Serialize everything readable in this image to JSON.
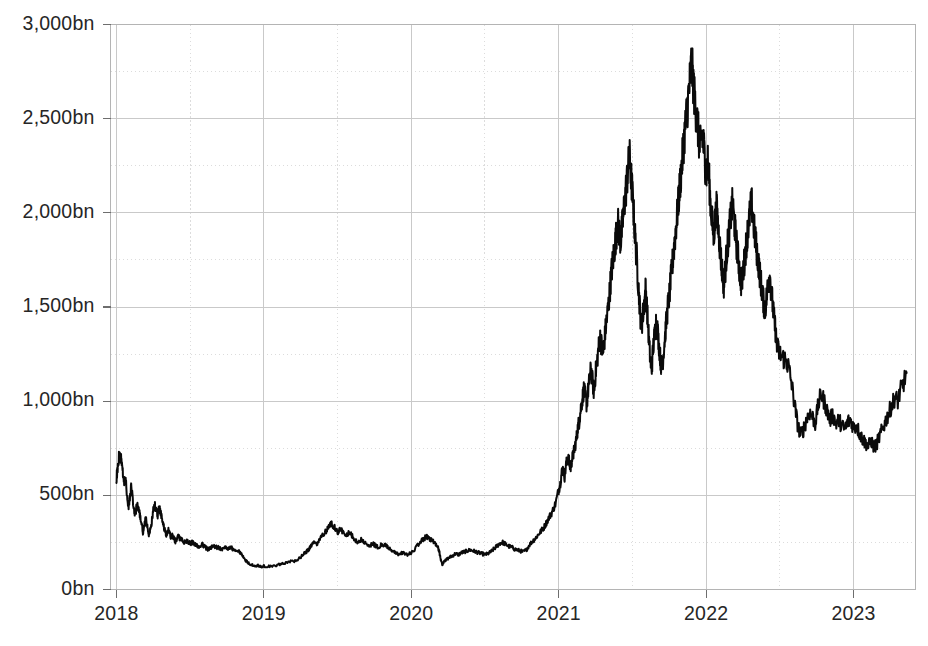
{
  "chart_data": {
    "type": "line",
    "title": "",
    "subtitle": "",
    "xlabel": "",
    "ylabel": "",
    "unit_suffix": "bn",
    "grid": true,
    "minor_grid": true,
    "legend": false,
    "legend_position": "none",
    "line_color": "#0a0a0a",
    "grid_color": "#c9c9c9",
    "minor_grid_color": "#dcdcdc",
    "border_color": "#b4b4b4",
    "label_color": "#262626",
    "background": "#ffffff",
    "xlim": [
      2017.96,
      2023.42
    ],
    "ylim": [
      0,
      3000
    ],
    "y_ticks": [
      0,
      500,
      1000,
      1500,
      2000,
      2500,
      3000
    ],
    "y_tick_labels": [
      "0bn",
      "500bn",
      "1,000bn",
      "1,500bn",
      "2,000bn",
      "2,500bn",
      "3,000bn"
    ],
    "y_minor_ticks": [
      250,
      750,
      1250,
      1750,
      2250,
      2750
    ],
    "x_ticks": [
      2018,
      2019,
      2020,
      2021,
      2022,
      2023
    ],
    "x_tick_labels": [
      "2018",
      "2019",
      "2020",
      "2021",
      "2022",
      "2023"
    ],
    "x_minor_ticks": [
      2018.5,
      2019.5,
      2020.5,
      2021.5,
      2022.5,
      2023.5
    ],
    "series": [
      {
        "name": "Market capitalisation",
        "color": "#0a0a0a",
        "x": [
          2018.0,
          2018.01,
          2018.02,
          2018.03,
          2018.04,
          2018.05,
          2018.06,
          2018.07,
          2018.08,
          2018.09,
          2018.1,
          2018.11,
          2018.12,
          2018.13,
          2018.14,
          2018.15,
          2018.16,
          2018.17,
          2018.18,
          2018.19,
          2018.2,
          2018.21,
          2018.22,
          2018.23,
          2018.24,
          2018.25,
          2018.26,
          2018.27,
          2018.28,
          2018.29,
          2018.3,
          2018.31,
          2018.32,
          2018.33,
          2018.34,
          2018.35,
          2018.36,
          2018.37,
          2018.38,
          2018.39,
          2018.4,
          2018.42,
          2018.44,
          2018.46,
          2018.48,
          2018.5,
          2018.52,
          2018.54,
          2018.56,
          2018.58,
          2018.6,
          2018.62,
          2018.64,
          2018.66,
          2018.68,
          2018.7,
          2018.72,
          2018.74,
          2018.76,
          2018.78,
          2018.8,
          2018.82,
          2018.84,
          2018.86,
          2018.88,
          2018.9,
          2018.92,
          2018.94,
          2018.96,
          2018.98,
          2019.0,
          2019.04,
          2019.08,
          2019.12,
          2019.16,
          2019.2,
          2019.24,
          2019.28,
          2019.3,
          2019.32,
          2019.34,
          2019.36,
          2019.38,
          2019.4,
          2019.42,
          2019.44,
          2019.46,
          2019.48,
          2019.5,
          2019.52,
          2019.54,
          2019.56,
          2019.58,
          2019.6,
          2019.62,
          2019.64,
          2019.66,
          2019.68,
          2019.7,
          2019.72,
          2019.74,
          2019.76,
          2019.78,
          2019.8,
          2019.82,
          2019.84,
          2019.86,
          2019.88,
          2019.9,
          2019.92,
          2019.94,
          2019.96,
          2019.98,
          2020.0,
          2020.04,
          2020.06,
          2020.08,
          2020.1,
          2020.12,
          2020.14,
          2020.16,
          2020.18,
          2020.19,
          2020.2,
          2020.21,
          2020.22,
          2020.24,
          2020.26,
          2020.28,
          2020.3,
          2020.32,
          2020.34,
          2020.36,
          2020.38,
          2020.4,
          2020.42,
          2020.44,
          2020.46,
          2020.48,
          2020.5,
          2020.52,
          2020.54,
          2020.56,
          2020.58,
          2020.6,
          2020.62,
          2020.64,
          2020.66,
          2020.68,
          2020.7,
          2020.72,
          2020.74,
          2020.76,
          2020.78,
          2020.8,
          2020.82,
          2020.84,
          2020.86,
          2020.88,
          2020.9,
          2020.92,
          2020.94,
          2020.96,
          2020.98,
          2021.0,
          2021.01,
          2021.02,
          2021.03,
          2021.04,
          2021.05,
          2021.06,
          2021.07,
          2021.08,
          2021.09,
          2021.1,
          2021.11,
          2021.12,
          2021.13,
          2021.14,
          2021.15,
          2021.16,
          2021.17,
          2021.18,
          2021.19,
          2021.2,
          2021.21,
          2021.22,
          2021.23,
          2021.24,
          2021.25,
          2021.26,
          2021.27,
          2021.28,
          2021.29,
          2021.3,
          2021.31,
          2021.32,
          2021.33,
          2021.34,
          2021.35,
          2021.36,
          2021.37,
          2021.38,
          2021.39,
          2021.4,
          2021.41,
          2021.42,
          2021.43,
          2021.44,
          2021.45,
          2021.46,
          2021.47,
          2021.48,
          2021.49,
          2021.5,
          2021.51,
          2021.52,
          2021.53,
          2021.54,
          2021.55,
          2021.56,
          2021.57,
          2021.58,
          2021.59,
          2021.6,
          2021.61,
          2021.62,
          2021.63,
          2021.64,
          2021.65,
          2021.66,
          2021.67,
          2021.68,
          2021.69,
          2021.7,
          2021.71,
          2021.72,
          2021.73,
          2021.74,
          2021.75,
          2021.76,
          2021.77,
          2021.78,
          2021.79,
          2021.8,
          2021.81,
          2021.82,
          2021.83,
          2021.84,
          2021.85,
          2021.86,
          2021.87,
          2021.88,
          2021.89,
          2021.9,
          2021.91,
          2021.92,
          2021.93,
          2021.94,
          2021.95,
          2021.96,
          2021.97,
          2021.98,
          2021.99,
          2022.0,
          2022.01,
          2022.02,
          2022.03,
          2022.04,
          2022.05,
          2022.06,
          2022.07,
          2022.08,
          2022.09,
          2022.1,
          2022.11,
          2022.12,
          2022.13,
          2022.14,
          2022.15,
          2022.16,
          2022.17,
          2022.18,
          2022.19,
          2022.2,
          2022.21,
          2022.22,
          2022.23,
          2022.24,
          2022.25,
          2022.26,
          2022.27,
          2022.28,
          2022.29,
          2022.3,
          2022.31,
          2022.32,
          2022.33,
          2022.34,
          2022.35,
          2022.36,
          2022.37,
          2022.38,
          2022.39,
          2022.4,
          2022.41,
          2022.42,
          2022.43,
          2022.44,
          2022.45,
          2022.46,
          2022.47,
          2022.48,
          2022.5,
          2022.52,
          2022.54,
          2022.56,
          2022.58,
          2022.6,
          2022.62,
          2022.64,
          2022.66,
          2022.68,
          2022.7,
          2022.72,
          2022.74,
          2022.76,
          2022.78,
          2022.8,
          2022.82,
          2022.84,
          2022.86,
          2022.88,
          2022.9,
          2022.92,
          2022.94,
          2022.96,
          2022.98,
          2023.0,
          2023.02,
          2023.04,
          2023.06,
          2023.08,
          2023.1,
          2023.12,
          2023.14,
          2023.16,
          2023.18,
          2023.2,
          2023.22,
          2023.24,
          2023.26,
          2023.28,
          2023.3,
          2023.32,
          2023.34,
          2023.36
        ],
        "values": [
          590,
          660,
          720,
          700,
          640,
          560,
          600,
          520,
          430,
          480,
          540,
          490,
          420,
          400,
          455,
          430,
          390,
          350,
          300,
          340,
          380,
          330,
          290,
          320,
          360,
          420,
          450,
          420,
          390,
          440,
          410,
          370,
          340,
          310,
          290,
          320,
          300,
          275,
          290,
          270,
          255,
          280,
          265,
          250,
          255,
          245,
          250,
          235,
          230,
          240,
          225,
          215,
          220,
          230,
          225,
          220,
          215,
          225,
          218,
          220,
          210,
          205,
          195,
          175,
          150,
          140,
          130,
          125,
          128,
          120,
          125,
          122,
          128,
          135,
          145,
          150,
          165,
          195,
          210,
          230,
          250,
          240,
          270,
          290,
          310,
          330,
          350,
          330,
          300,
          320,
          305,
          290,
          300,
          285,
          260,
          255,
          265,
          250,
          240,
          235,
          245,
          230,
          225,
          240,
          235,
          225,
          215,
          200,
          190,
          185,
          195,
          190,
          185,
          195,
          230,
          250,
          265,
          280,
          275,
          260,
          250,
          230,
          200,
          160,
          132,
          145,
          160,
          170,
          180,
          190,
          185,
          195,
          200,
          205,
          210,
          205,
          200,
          195,
          190,
          185,
          190,
          200,
          215,
          230,
          245,
          250,
          240,
          230,
          225,
          215,
          210,
          205,
          200,
          210,
          235,
          255,
          270,
          290,
          310,
          330,
          360,
          390,
          420,
          460,
          530,
          560,
          620,
          640,
          600,
          660,
          700,
          680,
          640,
          690,
          720,
          760,
          800,
          860,
          900,
          960,
          1010,
          1060,
          1030,
          980,
          1060,
          1120,
          1180,
          1100,
          1040,
          1150,
          1210,
          1280,
          1340,
          1300,
          1250,
          1320,
          1400,
          1460,
          1530,
          1620,
          1700,
          1760,
          1820,
          1880,
          1950,
          1900,
          1850,
          1920,
          2000,
          2080,
          2150,
          2230,
          2300,
          2200,
          2100,
          1980,
          1850,
          1750,
          1620,
          1500,
          1390,
          1450,
          1520,
          1600,
          1480,
          1350,
          1230,
          1160,
          1280,
          1350,
          1420,
          1380,
          1300,
          1220,
          1170,
          1250,
          1340,
          1420,
          1500,
          1560,
          1640,
          1720,
          1800,
          1880,
          1960,
          2040,
          2130,
          2210,
          2300,
          2390,
          2470,
          2540,
          2620,
          2700,
          2800,
          2720,
          2620,
          2550,
          2480,
          2400,
          2340,
          2420,
          2380,
          2300,
          2200,
          2280,
          2180,
          2050,
          1960,
          1880,
          1950,
          2030,
          1940,
          1850,
          1760,
          1680,
          1620,
          1700,
          1790,
          1860,
          1930,
          2000,
          2050,
          1960,
          1880,
          1810,
          1740,
          1670,
          1620,
          1680,
          1750,
          1820,
          1890,
          1950,
          2020,
          2040,
          1960,
          1880,
          1820,
          1760,
          1700,
          1640,
          1580,
          1520,
          1490,
          1550,
          1620,
          1680,
          1600,
          1520,
          1440,
          1380,
          1290,
          1250,
          1230,
          1220,
          1180,
          1090,
          980,
          880,
          820,
          850,
          900,
          940,
          920,
          880,
          980,
          1040,
          1000,
          950,
          900,
          930,
          880,
          900,
          870,
          850,
          890,
          900,
          860,
          870,
          830,
          800,
          780,
          760,
          790,
          750,
          780,
          820,
          860,
          900,
          940,
          980,
          1020,
          1000,
          1060,
          1100,
          1150
        ]
      }
    ],
    "annotations": {
      "start_value": 590,
      "peak_value": 2800,
      "peak_x": "2021.90",
      "end_value": 1150,
      "min_value": 120
    }
  }
}
